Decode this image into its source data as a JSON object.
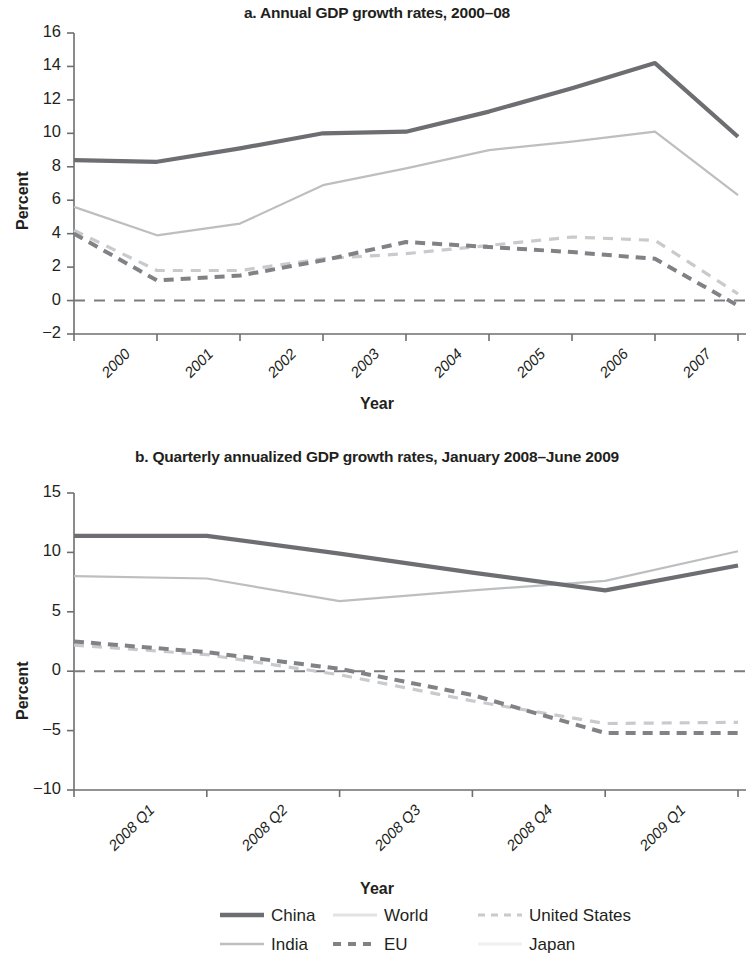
{
  "figure": {
    "axis_label_x": "Year",
    "axis_label_y": "Percent"
  },
  "panel_a": {
    "title": "a. Annual GDP growth rates, 2000–08",
    "axis_label_x": "Year",
    "axis_label_y": "Percent",
    "yticks": [
      "16",
      "14",
      "12",
      "10",
      "8",
      "6",
      "4",
      "2",
      "0",
      "−2"
    ],
    "xticks": [
      "2000",
      "2001",
      "2002",
      "2003",
      "2004",
      "2005",
      "2006",
      "2007",
      "2008"
    ]
  },
  "panel_b": {
    "title": "b. Quarterly annualized GDP growth rates, January 2008–June 2009",
    "axis_label_x": "Year",
    "axis_label_y": "Percent",
    "yticks": [
      "15",
      "10",
      "5",
      "0",
      "−5",
      "−10"
    ],
    "xticks": [
      "2008 Q1",
      "2008 Q2",
      "2008 Q3",
      "2008 Q4",
      "2009 Q1",
      "2009 Q2"
    ]
  },
  "legend": {
    "items": [
      {
        "label": "China",
        "style": "solid-dark",
        "color": "#6d6e71"
      },
      {
        "label": "World",
        "style": "solid-faint",
        "color": "#e2e3e4"
      },
      {
        "label": "United States",
        "style": "dashed-light",
        "color": "#c9cacc"
      },
      {
        "label": "India",
        "style": "solid-light",
        "color": "#bcbec0"
      },
      {
        "label": "EU",
        "style": "dashed-dark",
        "color": "#808285"
      },
      {
        "label": "Japan",
        "style": "solid-faintest",
        "color": "#f0f0f0"
      }
    ]
  },
  "chart_data": [
    {
      "id": "panel_a",
      "type": "line",
      "title": "a. Annual GDP growth rates, 2000–08",
      "xlabel": "Year",
      "ylabel": "Percent",
      "categories": [
        "2000",
        "2001",
        "2002",
        "2003",
        "2004",
        "2005",
        "2006",
        "2007",
        "2008"
      ],
      "ylim": [
        -2,
        16
      ],
      "yticks": [
        16,
        14,
        12,
        10,
        8,
        6,
        4,
        2,
        0,
        -2
      ],
      "grid": false,
      "zero_line": true,
      "legend_position": "bottom",
      "series": [
        {
          "name": "China",
          "style": "solid",
          "color": "#6d6e71",
          "values": [
            8.4,
            8.3,
            9.1,
            10.0,
            10.1,
            11.3,
            12.7,
            14.2,
            9.8
          ]
        },
        {
          "name": "India",
          "style": "solid",
          "color": "#bcbec0",
          "values": [
            5.6,
            3.9,
            4.6,
            6.9,
            7.9,
            9.0,
            9.5,
            10.1,
            6.3
          ]
        },
        {
          "name": "EU",
          "style": "dashed",
          "color": "#808285",
          "values": [
            4.0,
            1.2,
            1.5,
            2.4,
            3.5,
            3.2,
            2.9,
            2.5,
            -0.3
          ]
        },
        {
          "name": "United States",
          "style": "dashed",
          "color": "#c9cacc",
          "values": [
            4.2,
            1.8,
            1.8,
            2.5,
            2.8,
            3.3,
            3.8,
            3.6,
            0.4
          ]
        },
        {
          "name": "World",
          "style": "solid",
          "color": "#e2e3e4",
          "values": [
            null,
            null,
            null,
            null,
            null,
            null,
            null,
            null,
            null
          ]
        },
        {
          "name": "Japan",
          "style": "solid",
          "color": "#f0f0f0",
          "values": [
            null,
            null,
            null,
            null,
            null,
            null,
            null,
            null,
            null
          ]
        }
      ]
    },
    {
      "id": "panel_b",
      "type": "line",
      "title": "b. Quarterly annualized GDP growth rates, January 2008–June 2009",
      "xlabel": "Year",
      "ylabel": "Percent",
      "categories": [
        "2008 Q1",
        "2008 Q2",
        "2008 Q3",
        "2008 Q4",
        "2009 Q1",
        "2009 Q2"
      ],
      "ylim": [
        -10,
        15
      ],
      "yticks": [
        15,
        10,
        5,
        0,
        -5,
        -10
      ],
      "grid": false,
      "zero_line": true,
      "legend_position": "bottom",
      "series": [
        {
          "name": "China",
          "style": "solid",
          "color": "#6d6e71",
          "values": [
            11.4,
            11.4,
            9.9,
            8.3,
            6.8,
            8.9
          ]
        },
        {
          "name": "India",
          "style": "solid",
          "color": "#bcbec0",
          "values": [
            8.0,
            7.8,
            5.9,
            6.8,
            7.6,
            10.1
          ]
        },
        {
          "name": "EU",
          "style": "dashed",
          "color": "#808285",
          "values": [
            2.5,
            1.6,
            0.2,
            -2.0,
            -5.2,
            -5.2
          ]
        },
        {
          "name": "United States",
          "style": "dashed",
          "color": "#c9cacc",
          "values": [
            2.2,
            1.4,
            -0.3,
            -2.5,
            -4.4,
            -4.3
          ]
        },
        {
          "name": "World",
          "style": "solid",
          "color": "#e2e3e4",
          "values": [
            null,
            null,
            null,
            null,
            null,
            null
          ]
        },
        {
          "name": "Japan",
          "style": "solid",
          "color": "#f0f0f0",
          "values": [
            null,
            null,
            null,
            null,
            null,
            null
          ]
        }
      ]
    }
  ]
}
